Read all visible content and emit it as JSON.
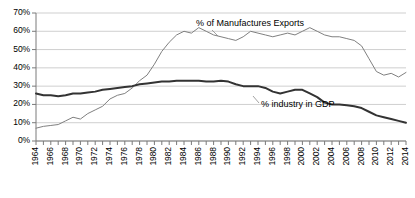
{
  "chart_data": {
    "type": "line",
    "title": "",
    "subtitle": "",
    "xlabel": "",
    "ylabel": "",
    "grid": true,
    "legend_position": "inline-annotation",
    "xlim": [
      1964,
      2014
    ],
    "ylim": [
      0,
      70
    ],
    "ytick_labels": [
      "70%",
      "60%",
      "50%",
      "40%",
      "30%",
      "20%",
      "10%",
      "0%"
    ],
    "ytick_values": [
      70,
      60,
      50,
      40,
      30,
      20,
      10,
      0
    ],
    "xtick_labels": [
      "1964",
      "1966",
      "1968",
      "1970",
      "1972",
      "1974",
      "1976",
      "1978",
      "1980",
      "1982",
      "1984",
      "1986",
      "1988",
      "1990",
      "1992",
      "1994",
      "1996",
      "1998",
      "2000",
      "2002",
      "2004",
      "2006",
      "2008",
      "2010",
      "2012",
      "2014"
    ],
    "xtick_values": [
      1964,
      1966,
      1968,
      1970,
      1972,
      1974,
      1976,
      1978,
      1980,
      1982,
      1984,
      1986,
      1988,
      1990,
      1992,
      1994,
      1996,
      1998,
      2000,
      2002,
      2004,
      2006,
      2008,
      2010,
      2012,
      2014
    ],
    "x": [
      1964,
      1965,
      1966,
      1967,
      1968,
      1969,
      1970,
      1971,
      1972,
      1973,
      1974,
      1975,
      1976,
      1977,
      1978,
      1979,
      1980,
      1981,
      1982,
      1983,
      1984,
      1985,
      1986,
      1987,
      1988,
      1989,
      1990,
      1991,
      1992,
      1993,
      1994,
      1995,
      1996,
      1997,
      1998,
      1999,
      2000,
      2001,
      2002,
      2003,
      2004,
      2005,
      2006,
      2007,
      2008,
      2009,
      2010,
      2011,
      2012,
      2013,
      2014
    ],
    "series": [
      {
        "name": "% of Manufactures Exports",
        "color": "#808080",
        "line_width": 1,
        "values": [
          7,
          8,
          8.5,
          9,
          11,
          13,
          12,
          15,
          17,
          19,
          23,
          25,
          26,
          29,
          33,
          36,
          42,
          49,
          54,
          58,
          60,
          59,
          62,
          60,
          58,
          57,
          56,
          55,
          57,
          60,
          59,
          58,
          57,
          58,
          59,
          58,
          60,
          62,
          60,
          58,
          57,
          57,
          56,
          55,
          52,
          45,
          38,
          36,
          37,
          35,
          37.5
        ]
      },
      {
        "name": "% industry in GDP",
        "color": "#333333",
        "line_width": 2,
        "values": [
          26,
          25,
          25,
          24.5,
          25,
          26,
          26,
          26.5,
          27,
          28,
          28.5,
          29,
          29.5,
          30,
          31,
          31.5,
          32,
          32.5,
          32.5,
          33,
          33,
          33,
          33,
          32.5,
          32.5,
          33,
          32.5,
          31,
          30,
          30,
          30,
          29,
          27,
          26,
          27,
          28,
          28,
          26,
          24,
          21,
          20,
          20,
          19.5,
          19,
          18,
          16,
          14,
          13,
          12,
          11,
          10
        ]
      }
    ],
    "annotations": [
      {
        "name": "% of Manufactures Exports",
        "text": "% of Manufactures Exports"
      },
      {
        "name": "% industry in GDP",
        "text": "% industry in GDP"
      }
    ]
  }
}
